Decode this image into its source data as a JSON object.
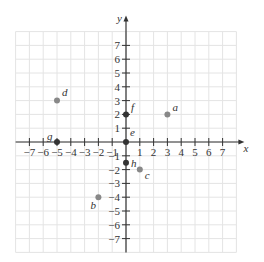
{
  "chart_data": {
    "type": "scatter",
    "title": "",
    "xlabel": "x",
    "ylabel": "y",
    "xlim": [
      -8,
      8
    ],
    "ylim": [
      -8,
      8
    ],
    "grid": true,
    "x_ticks": [
      -7,
      -6,
      -5,
      -4,
      -3,
      -2,
      -1,
      1,
      2,
      3,
      4,
      5,
      6,
      7
    ],
    "y_ticks": [
      -7,
      -6,
      -5,
      -4,
      -3,
      -2,
      -1,
      1,
      2,
      3,
      4,
      5,
      6,
      7
    ],
    "points": [
      {
        "label": "a",
        "x": 3,
        "y": 2
      },
      {
        "label": "b",
        "x": -2,
        "y": -4
      },
      {
        "label": "c",
        "x": 1,
        "y": -2
      },
      {
        "label": "d",
        "x": -5,
        "y": 3
      },
      {
        "label": "e",
        "x": 0,
        "y": 0
      },
      {
        "label": "f",
        "x": 0,
        "y": 2
      },
      {
        "label": "g",
        "x": -5,
        "y": 0
      },
      {
        "label": "h",
        "x": 0,
        "y": -1.5
      }
    ],
    "colors": {
      "point": "#888888",
      "axis_point": "#333333",
      "grid": "#e4e4e4",
      "axis": "#333333"
    }
  }
}
